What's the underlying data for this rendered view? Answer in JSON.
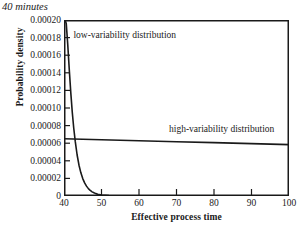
{
  "chart_data": {
    "type": "line",
    "title": "40 minutes",
    "xlabel": "Effective process time",
    "ylabel": "Probability density",
    "xlim": [
      40,
      100
    ],
    "ylim": [
      0,
      0.0002
    ],
    "grid": false,
    "legend_position": "inline-annotations",
    "xticks": [
      40,
      50,
      60,
      70,
      80,
      90,
      100
    ],
    "xtick_labels": [
      "40",
      "50",
      "60",
      "70",
      "80",
      "90",
      "100"
    ],
    "yticks": [
      0,
      2e-05,
      4e-05,
      6e-05,
      8e-05,
      0.0001,
      0.00012,
      0.00014,
      0.00016,
      0.00018,
      0.0002
    ],
    "ytick_labels": [
      "0",
      "0.00002",
      "0.00004",
      "0.00006",
      "0.00008",
      "0.00010",
      "0.00012",
      "0.00014",
      "0.00016",
      "0.00018",
      "0.00020"
    ],
    "annotations": [
      {
        "text": "low-variability distribution",
        "x": 42.5,
        "y": 0.000182
      },
      {
        "text": "high-variability distribution",
        "x": 68,
        "y": 7.55e-05
      }
    ],
    "series": [
      {
        "name": "low-variability distribution",
        "color": "#1a1a1a",
        "x": [
          40.0,
          40.3,
          40.6,
          41.0,
          41.4,
          41.8,
          42.2,
          42.6,
          43.0,
          43.5,
          44.0,
          44.5,
          45.0,
          45.5,
          46.0,
          46.5,
          47.0,
          47.5,
          48.0,
          48.5,
          49.0,
          50.0,
          52.0,
          55.0,
          60.0,
          70.0,
          85.0,
          100.0
        ],
        "y": [
          0.0002,
          0.0002,
          0.000196,
          0.000172,
          0.000144,
          0.000118,
          9.55e-05,
          7.7e-05,
          6.2e-05,
          4.66e-05,
          3.5e-05,
          2.63e-05,
          1.98e-05,
          1.49e-05,
          1.12e-05,
          8.4e-06,
          6.3e-06,
          4.7e-06,
          3.6e-06,
          2.7e-06,
          2e-06,
          1.1e-06,
          4e-07,
          1e-07,
          0.0,
          0.0,
          0.0,
          0.0
        ]
      },
      {
        "name": "high-variability distribution",
        "color": "#1a1a1a",
        "x": [
          40,
          50,
          60,
          70,
          80,
          90,
          100
        ],
        "y": [
          6.5e-05,
          6.39e-05,
          6.28e-05,
          6.17e-05,
          6.06e-05,
          5.95e-05,
          5.84e-05
        ]
      }
    ]
  },
  "figure": {
    "title": "40 minutes",
    "xlabel": "Effective process time",
    "ylabel": "Probability density",
    "annotation_low": "low-variability distribution",
    "annotation_high": "high-variability distribution",
    "axis_color": "#1a1a1a",
    "background": "#ffffff"
  }
}
